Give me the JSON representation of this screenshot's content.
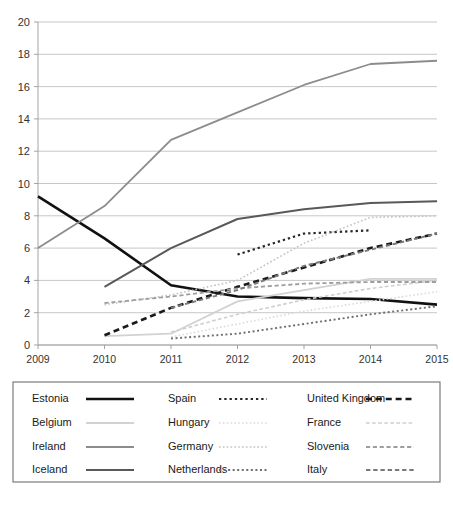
{
  "chart_data": {
    "type": "line",
    "title": "",
    "subtitle": "",
    "xlabel": "",
    "ylabel": "",
    "x": [
      2009,
      2010,
      2011,
      2012,
      2013,
      2014,
      2015
    ],
    "xtick_labels": [
      "2009",
      "2010",
      "2011",
      "2012",
      "2013",
      "2014",
      "2015"
    ],
    "ytick_labels": [
      "0",
      "2",
      "4",
      "6",
      "8",
      "10",
      "12",
      "14",
      "16",
      "18",
      "20"
    ],
    "ylim": [
      0,
      20
    ],
    "ytick_step": 2,
    "xlim": [
      2009,
      2015
    ],
    "grid": "horizontal",
    "legend_position": "bottom",
    "legend_columns": 3,
    "legend_rows": 4,
    "series": [
      {
        "name": "Estonia",
        "style": "solid",
        "width": 2.6,
        "color": "#111111",
        "x": [
          2009,
          2010,
          2011,
          2012,
          2013,
          2014,
          2015
        ],
        "values": [
          9.2,
          6.6,
          3.7,
          3.0,
          2.9,
          2.85,
          2.5
        ]
      },
      {
        "name": "Belgium",
        "style": "solid",
        "width": 1.8,
        "color": "#d2d2d2",
        "x": [
          2010,
          2011,
          2012,
          2013,
          2014,
          2015
        ],
        "values": [
          0.55,
          0.7,
          2.7,
          3.4,
          4.1,
          4.1
        ]
      },
      {
        "name": "Ireland",
        "style": "solid",
        "width": 1.8,
        "color": "#8c8c8c",
        "x": [
          2009,
          2010,
          2011,
          2012,
          2013,
          2014,
          2015
        ],
        "values": [
          6.0,
          8.6,
          12.7,
          14.4,
          16.1,
          17.4,
          17.6
        ]
      },
      {
        "name": "Iceland",
        "style": "solid",
        "width": 2.0,
        "color": "#595959",
        "x": [
          2010,
          2011,
          2012,
          2013,
          2014,
          2015
        ],
        "values": [
          3.6,
          6.0,
          7.8,
          8.4,
          8.8,
          8.9
        ]
      },
      {
        "name": "Spain",
        "style": "dotted",
        "width": 2.2,
        "color": "#262626",
        "x": [
          2012,
          2013,
          2014
        ],
        "values": [
          5.6,
          6.9,
          7.1
        ]
      },
      {
        "name": "Hungary",
        "style": "dotted",
        "width": 1.6,
        "color": "#dcdcdc",
        "x": [
          2011,
          2012,
          2013,
          2014,
          2015
        ],
        "values": [
          0.5,
          1.3,
          2.1,
          2.7,
          3.3
        ]
      },
      {
        "name": "Germany",
        "style": "dotted",
        "width": 1.6,
        "color": "#c4c4c4",
        "x": [
          2010,
          2011,
          2012,
          2013,
          2014,
          2015
        ],
        "values": [
          2.5,
          3.1,
          4.0,
          6.3,
          7.9,
          8.0
        ]
      },
      {
        "name": "Netherlands",
        "style": "dotted",
        "width": 1.9,
        "color": "#6e6e6e",
        "x": [
          2011,
          2012,
          2013,
          2014,
          2015
        ],
        "values": [
          0.4,
          0.7,
          1.3,
          1.9,
          2.4
        ]
      },
      {
        "name": "United Kingdom",
        "style": "dashed",
        "width": 2.6,
        "color": "#1a1a1a",
        "x": [
          2010,
          2011,
          2012,
          2013,
          2014,
          2015
        ],
        "values": [
          0.6,
          2.3,
          3.6,
          4.8,
          6.0,
          6.9
        ]
      },
      {
        "name": "France",
        "style": "dashed",
        "width": 1.6,
        "color": "#cfcfcf",
        "x": [
          2011,
          2012,
          2013,
          2014,
          2015
        ],
        "values": [
          0.8,
          1.9,
          2.8,
          3.5,
          4.0
        ]
      },
      {
        "name": "Slovenia",
        "style": "dashed",
        "width": 1.8,
        "color": "#9e9e9e",
        "x": [
          2010,
          2011,
          2012,
          2013,
          2014,
          2015
        ],
        "values": [
          2.6,
          3.0,
          3.5,
          3.8,
          3.9,
          3.9
        ]
      },
      {
        "name": "Italy",
        "style": "dashed",
        "width": 1.9,
        "color": "#7a7a7a",
        "x": [
          2011,
          2012,
          2013,
          2014,
          2015
        ],
        "values": [
          2.3,
          3.4,
          4.9,
          5.9,
          6.9
        ]
      }
    ]
  },
  "legend": {
    "columns": [
      {
        "items": [
          {
            "label": "Estonia",
            "series": "Estonia"
          },
          {
            "label": "Belgium",
            "series": "Belgium"
          },
          {
            "label": "Ireland",
            "series": "Ireland"
          },
          {
            "label": "Iceland",
            "series": "Iceland"
          }
        ]
      },
      {
        "items": [
          {
            "label": "Spain",
            "series": "Spain"
          },
          {
            "label": "Hungary",
            "series": "Hungary"
          },
          {
            "label": "Germany",
            "series": "Germany"
          },
          {
            "label": "Netherlands",
            "series": "Netherlands"
          }
        ]
      },
      {
        "items": [
          {
            "label": "United Kingdom",
            "series": "United Kingdom"
          },
          {
            "label": "France",
            "series": "France"
          },
          {
            "label": "Slovenia",
            "series": "Slovenia"
          },
          {
            "label": "Italy",
            "series": "Italy"
          }
        ]
      }
    ]
  },
  "colors": {
    "background": "#ffffff",
    "gridline": "#b9b9b9",
    "axis": "#9a9a9a",
    "text": "#1a1a1a",
    "legend_border": "#6f6f6f"
  }
}
